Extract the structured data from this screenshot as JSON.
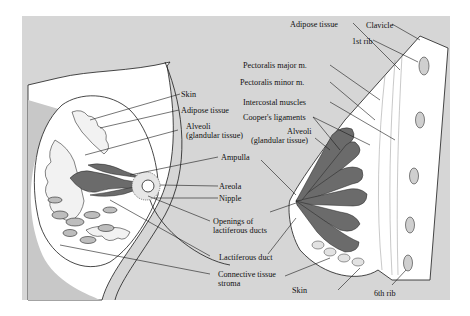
{
  "figure": {
    "colors": {
      "background": "#d6d6d6",
      "tissue": "#ffffff",
      "glandular": "#6b6b6b",
      "line": "#1a1a1a"
    }
  },
  "left_view": {
    "labels": [
      {
        "id": "skin",
        "text": "Skin"
      },
      {
        "id": "adipose",
        "text": "Adipose tissue"
      },
      {
        "id": "alveoli_1",
        "text": "Alveoli"
      },
      {
        "id": "alveoli_2",
        "text": "(glandular tissue)"
      },
      {
        "id": "ampulla",
        "text": "Ampulla"
      },
      {
        "id": "areola",
        "text": "Areola"
      },
      {
        "id": "nipple",
        "text": "Nipple"
      },
      {
        "id": "openings_1",
        "text": "Openings of"
      },
      {
        "id": "openings_2",
        "text": "lactiferous ducts"
      },
      {
        "id": "lactiferous_duct",
        "text": "Lactiferous duct"
      },
      {
        "id": "connective_1",
        "text": "Connective tissue"
      },
      {
        "id": "connective_2",
        "text": "stroma"
      }
    ]
  },
  "right_view": {
    "labels": [
      {
        "id": "clavicle",
        "text": "Clavicle"
      },
      {
        "id": "rib1",
        "text": "1st rib"
      },
      {
        "id": "adipose",
        "text": "Adipose tissue"
      },
      {
        "id": "pect_major",
        "text": "Pectoralis major m."
      },
      {
        "id": "pect_minor",
        "text": "Pectoralis minor m."
      },
      {
        "id": "intercostal",
        "text": "Intercostal muscles"
      },
      {
        "id": "coopers",
        "text": "Cooper's ligaments"
      },
      {
        "id": "alveoli_1",
        "text": "Alveoli"
      },
      {
        "id": "alveoli_2",
        "text": "(glandular tissue)"
      },
      {
        "id": "skin",
        "text": "Skin"
      },
      {
        "id": "rib6",
        "text": "6th rib"
      }
    ]
  }
}
